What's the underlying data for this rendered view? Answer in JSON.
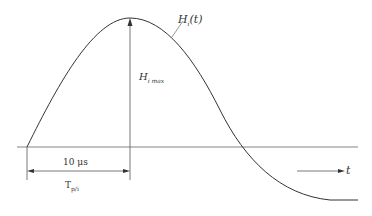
{
  "diagram": {
    "curve_label": "H",
    "curve_label_sub": "i",
    "curve_label_arg": "(t)",
    "peak_label": "H",
    "peak_label_sub": "i max",
    "duration_label": "10 μs",
    "time_label": "T",
    "time_label_sub": "p/i",
    "axis_label": "t"
  },
  "colors": {
    "line": "#333333",
    "axis": "#555555"
  }
}
